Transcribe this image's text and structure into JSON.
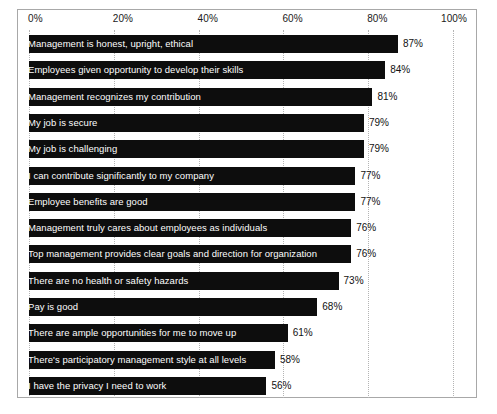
{
  "chart_data": {
    "type": "bar",
    "orientation": "horizontal",
    "title": "",
    "xlabel": "",
    "ylabel": "",
    "xlim": [
      0,
      100
    ],
    "grid": true,
    "legend": null,
    "tick_labels": [
      "0%",
      "20%",
      "40%",
      "60%",
      "80%",
      "100%"
    ],
    "ticks": [
      0,
      20,
      40,
      60,
      80,
      100
    ],
    "value_suffix": "%",
    "bar_color": "#0d0d0d",
    "label_color": "#fdfdfd",
    "categories": [
      "Management is honest, upright, ethical",
      "Employees given opportunity to develop their skills",
      "Management recognizes my contribution",
      "My job is secure",
      "My job is challenging",
      "I can contribute significantly to my company",
      "Employee benefits are good",
      "Management truly cares about employees as individuals",
      "Top management provides clear goals and direction for organization",
      "There are no health or safety hazards",
      "Pay is good",
      "There are ample opportunities for me to move up",
      "There's participatory management style at all levels",
      "I have the privacy I need to work"
    ],
    "values": [
      87,
      84,
      81,
      79,
      79,
      77,
      77,
      76,
      76,
      73,
      68,
      61,
      58,
      56
    ],
    "value_labels": [
      "87%",
      "84%",
      "81%",
      "79%",
      "79%",
      "77%",
      "77%",
      "76%",
      "76%",
      "73%",
      "68%",
      "61%",
      "58%",
      "56%"
    ]
  },
  "caption": ""
}
